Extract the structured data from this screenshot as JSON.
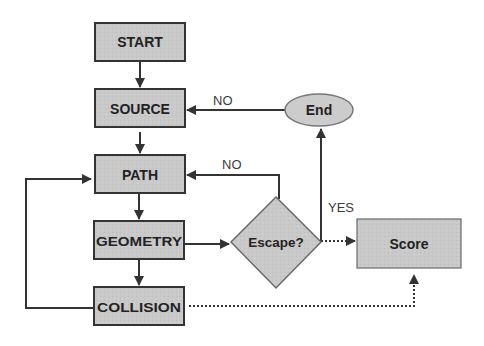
{
  "diagram": {
    "colors": {
      "node_fill": "#c8c8c8",
      "node_stroke": "#333333",
      "decision_fill": "#c4c4c4",
      "decision_stroke": "#6a6a6a",
      "score_fill": "#cfcfcf",
      "line": "#333333"
    },
    "nodes": {
      "start": {
        "label": "START",
        "shape": "rectangle"
      },
      "source": {
        "label": "SOURCE",
        "shape": "rectangle"
      },
      "path": {
        "label": "PATH",
        "shape": "rectangle"
      },
      "geometry": {
        "label": "GEOMETRY",
        "shape": "rectangle"
      },
      "collision": {
        "label": "COLLISION",
        "shape": "rectangle"
      },
      "end": {
        "label": "End",
        "shape": "ellipse"
      },
      "escape": {
        "label": "Escape?",
        "shape": "diamond"
      },
      "score": {
        "label": "Score",
        "shape": "rectangle"
      }
    },
    "edges": [
      {
        "from": "START",
        "to": "SOURCE",
        "style": "solid",
        "label": ""
      },
      {
        "from": "SOURCE",
        "to": "PATH",
        "style": "solid",
        "label": ""
      },
      {
        "from": "PATH",
        "to": "GEOMETRY",
        "style": "solid",
        "label": ""
      },
      {
        "from": "GEOMETRY",
        "to": "COLLISION",
        "style": "solid",
        "label": ""
      },
      {
        "from": "GEOMETRY",
        "to": "Escape?",
        "style": "solid",
        "label": ""
      },
      {
        "from": "Escape?",
        "to": "PATH",
        "style": "solid",
        "label": "NO"
      },
      {
        "from": "Escape?",
        "to": "End",
        "style": "solid",
        "label": "YES"
      },
      {
        "from": "End",
        "to": "SOURCE",
        "style": "solid",
        "label": "NO"
      },
      {
        "from": "Escape?",
        "to": "Score",
        "style": "dotted",
        "label": ""
      },
      {
        "from": "COLLISION",
        "to": "PATH",
        "style": "solid",
        "label": ""
      },
      {
        "from": "COLLISION",
        "to": "Score",
        "style": "dotted",
        "label": ""
      }
    ],
    "edge_labels": {
      "end_to_source": "NO",
      "escape_to_path": "NO",
      "escape_to_end": "YES"
    }
  }
}
